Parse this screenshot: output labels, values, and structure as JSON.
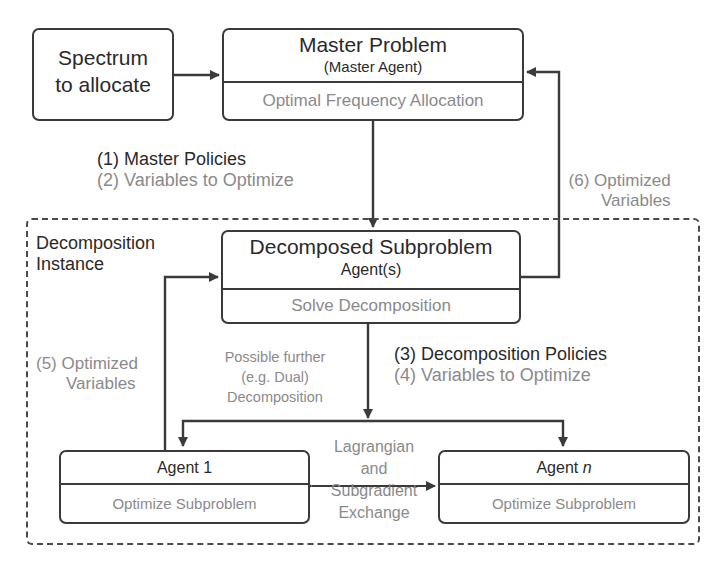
{
  "diagram": {
    "colors": {
      "line": "#3a3a3a",
      "primary_text": "#2a2a2a",
      "secondary_text": "#8a8a8a",
      "background": "#ffffff"
    },
    "spectrum_box": {
      "line1": "Spectrum",
      "line2": "to allocate"
    },
    "master_box": {
      "title": "Master Problem",
      "subtitle": "(Master Agent)",
      "body": "Optimal Frequency Allocation"
    },
    "master_policies_label": {
      "line1": "(1) Master Policies",
      "line2": "(2) Variables to Optimize"
    },
    "feedback_top_label": {
      "line1": "(6) Optimized",
      "line2": "Variables"
    },
    "container": {
      "label_line1": "Decomposition",
      "label_line2": "Instance"
    },
    "decomposed_box": {
      "title": "Decomposed Subproblem",
      "subtitle": "Agent(s)",
      "body": "Solve Decomposition"
    },
    "feedback_left_label": {
      "line1": "(5) Optimized",
      "line2": "Variables"
    },
    "further_decomposition_label": {
      "line1": "Possible further",
      "line2": "(e.g. Dual)",
      "line3": "Decomposition"
    },
    "decomposition_policies_label": {
      "line1": "(3) Decomposition Policies",
      "line2": "(4) Variables to Optimize"
    },
    "agent1_box": {
      "title": "Agent 1",
      "body": "Optimize Subproblem"
    },
    "agentn_box": {
      "title_prefix": "Agent ",
      "title_var": "n",
      "body": "Optimize Subproblem"
    },
    "exchange_label": {
      "line1": "Lagrangian",
      "line2": "and",
      "line3": "Subgradient",
      "line4": "Exchange"
    }
  }
}
